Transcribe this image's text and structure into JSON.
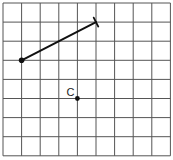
{
  "diagram": {
    "type": "grid-geometry",
    "grid": {
      "columns": 9,
      "rows": 8,
      "origin_px": [
        3,
        3
      ],
      "cell_w": 18.6,
      "cell_h": 19.1,
      "line_color": "#555555"
    },
    "segment": {
      "start": {
        "col": 1,
        "row": 3,
        "marker": "dot"
      },
      "end": {
        "col": 5,
        "row": 1,
        "marker": "tick"
      },
      "color": "#111111"
    },
    "points": [
      {
        "label": "C",
        "col": 4,
        "row": 5
      }
    ]
  }
}
